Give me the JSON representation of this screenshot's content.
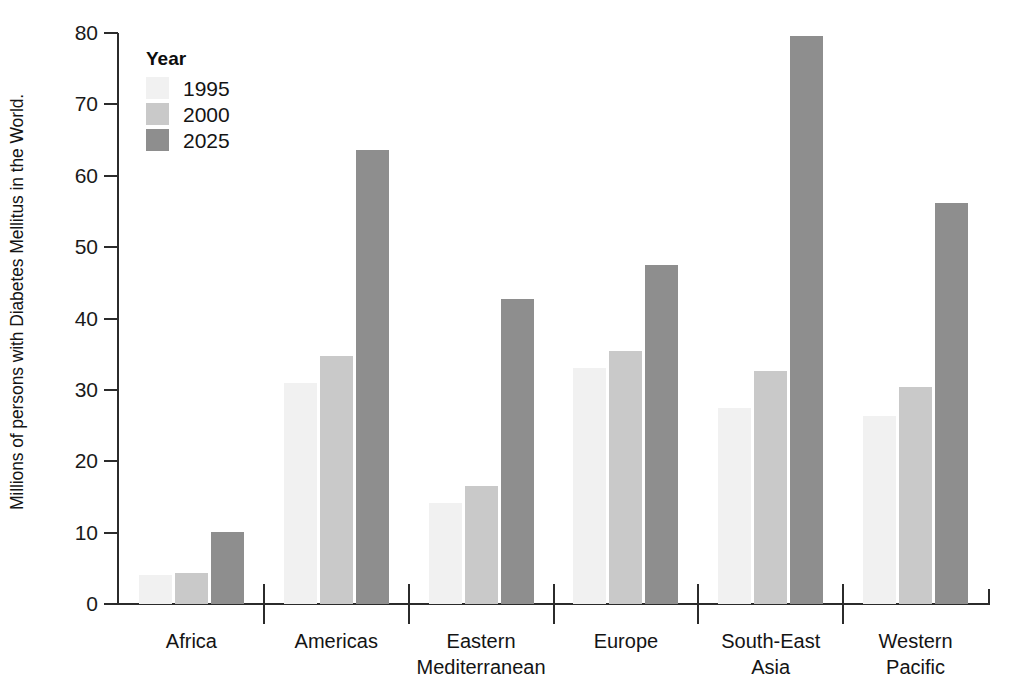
{
  "chart_data": {
    "type": "bar",
    "title": "",
    "subtitle": "",
    "xlabel": "",
    "ylabel": "Millions of persons with Diabetes Mellitus in the World.",
    "ylim": [
      0,
      80
    ],
    "ytick_labels": [
      "0",
      "10",
      "20",
      "30",
      "40",
      "50",
      "60",
      "70",
      "80"
    ],
    "ytick_values": [
      0,
      10,
      20,
      30,
      40,
      50,
      60,
      70,
      80
    ],
    "grid": false,
    "legend_position": "top-left",
    "legend_title": "Year",
    "categories": [
      "Africa",
      "Americas",
      "Eastern Mediterranean",
      "Europe",
      "South-East Asia",
      "Western Pacific"
    ],
    "category_lines": [
      [
        "Africa"
      ],
      [
        "Americas"
      ],
      [
        "Eastern",
        "Mediterranean"
      ],
      [
        "Europe"
      ],
      [
        "South-East",
        "Asia"
      ],
      [
        "Western",
        "Pacific"
      ]
    ],
    "series": [
      {
        "name": "1995",
        "color": "#f1f1f1",
        "values": [
          4.0,
          30.9,
          14.1,
          33.0,
          27.4,
          26.4
        ]
      },
      {
        "name": "2000",
        "color": "#c9c9c9",
        "values": [
          4.3,
          34.7,
          16.6,
          35.4,
          32.6,
          30.4
        ]
      },
      {
        "name": "2025",
        "color": "#8e8e8e",
        "values": [
          10.1,
          63.6,
          42.7,
          47.5,
          79.6,
          56.2
        ]
      }
    ]
  },
  "colors": {
    "axis": "#2b2b2b",
    "text": "#141414",
    "background": "#ffffff",
    "series_1995": "#f1f1f1",
    "series_2000": "#c9c9c9",
    "series_2025": "#8e8e8e"
  }
}
